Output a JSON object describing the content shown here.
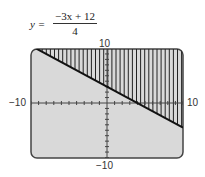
{
  "equation": {
    "lhs": "y =",
    "numerator": "−3x + 12",
    "denominator": "4"
  },
  "axis_labels": {
    "ymax": "10",
    "ymin": "−10",
    "xmin": "−10",
    "xmax": "10"
  },
  "colors": {
    "screen": "#d9d9d9",
    "border": "#444444",
    "line": "#111111",
    "hatch": "#222222"
  },
  "chart_data": {
    "type": "line",
    "xlabel": "",
    "ylabel": "",
    "xlim": [
      -10,
      10
    ],
    "ylim": [
      -10,
      10
    ],
    "grid": false,
    "series": [
      {
        "name": "y = (-3x+12)/4",
        "x": [
          -10,
          10
        ],
        "y": [
          10.5,
          -4.5
        ]
      }
    ],
    "shaded_region": "above line (y > (-3x+12)/4), vertical hatching",
    "ticks": {
      "x_step": 1,
      "y_step": 1
    }
  }
}
